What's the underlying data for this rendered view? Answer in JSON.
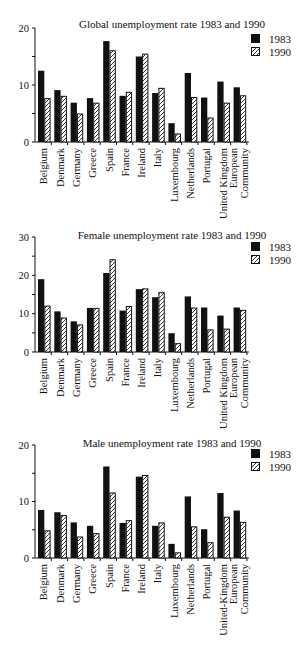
{
  "chart_data": [
    {
      "type": "bar",
      "title": "Global unemployment rate 1983 and 1990",
      "xlabel": "",
      "ylabel": "",
      "ylim": [
        0,
        20
      ],
      "yticks": [
        0,
        10,
        20
      ],
      "grid": false,
      "legend_position": "top-right",
      "categories": [
        "Belgium",
        "Denmark",
        "Germany",
        "Greece",
        "Spain",
        "France",
        "Ireland",
        "Italy",
        "Luxembourg",
        "Netherlands",
        "Portugal",
        "United Kingdom",
        "European Community"
      ],
      "category_lines": [
        [
          "Belgium"
        ],
        [
          "Denmark"
        ],
        [
          "Germany"
        ],
        [
          "Greece"
        ],
        [
          "Spain"
        ],
        [
          "France"
        ],
        [
          "Ireland"
        ],
        [
          "Italy"
        ],
        [
          "Luxembourg"
        ],
        [
          "Netherlands"
        ],
        [
          "Portugal"
        ],
        [
          "United Kingdom"
        ],
        [
          "European",
          "Community"
        ]
      ],
      "series": [
        {
          "name": "1983",
          "style": "solid",
          "values": [
            12.5,
            9.1,
            6.9,
            7.7,
            17.7,
            8.1,
            15.0,
            8.6,
            3.3,
            12.1,
            7.8,
            10.6,
            9.6
          ]
        },
        {
          "name": "1990",
          "style": "hatched",
          "values": [
            7.7,
            8.1,
            5.0,
            6.9,
            16.1,
            8.8,
            15.5,
            9.5,
            1.5,
            7.9,
            4.3,
            6.9,
            8.2
          ]
        }
      ]
    },
    {
      "type": "bar",
      "title": "Female unemployment rate 1983 and 1990",
      "xlabel": "",
      "ylabel": "",
      "ylim": [
        0,
        30
      ],
      "yticks": [
        0,
        10,
        20,
        30
      ],
      "grid": false,
      "legend_position": "top-right",
      "categories": [
        "Belgium",
        "Denmark",
        "Germany",
        "Greece",
        "Spain",
        "France",
        "Ireland",
        "Italy",
        "Luxembourg",
        "Netherlands",
        "Portugal",
        "United Kingdom",
        "European Community"
      ],
      "category_lines": [
        [
          "Belgium"
        ],
        [
          "Denmark"
        ],
        [
          "Germany"
        ],
        [
          "Greece"
        ],
        [
          "Spain"
        ],
        [
          "France"
        ],
        [
          "Ireland"
        ],
        [
          "Italy"
        ],
        [
          "Luxembourg"
        ],
        [
          "Netherlands"
        ],
        [
          "Portugal"
        ],
        [
          "United Kingdom"
        ],
        [
          "European",
          "Community"
        ]
      ],
      "series": [
        {
          "name": "1983",
          "style": "solid",
          "values": [
            19.0,
            10.6,
            8.0,
            11.5,
            20.6,
            10.8,
            16.4,
            14.3,
            4.9,
            14.5,
            11.6,
            9.5,
            11.6
          ]
        },
        {
          "name": "1990",
          "style": "hatched",
          "values": [
            12.1,
            9.0,
            7.2,
            11.5,
            24.2,
            12.0,
            16.6,
            15.6,
            2.3,
            11.6,
            5.9,
            6.1,
            11.0
          ]
        }
      ]
    },
    {
      "type": "bar",
      "title": "Male unemployment rate 1983 and 1990",
      "xlabel": "",
      "ylabel": "",
      "ylim": [
        0,
        20
      ],
      "yticks": [
        0,
        10,
        20
      ],
      "grid": false,
      "legend_position": "top-right",
      "categories": [
        "Belgium",
        "Denmark",
        "Germany",
        "Greece",
        "Spain",
        "France",
        "Ireland",
        "Italy",
        "Luxembourg",
        "Netherlands",
        "Portugal",
        "United-Kingdom",
        "European Community"
      ],
      "category_lines": [
        [
          "Belgium"
        ],
        [
          "Denmark"
        ],
        [
          "Germany"
        ],
        [
          "Greece"
        ],
        [
          "Spain"
        ],
        [
          "France"
        ],
        [
          "Ireland"
        ],
        [
          "Italy"
        ],
        [
          "Luxembourg"
        ],
        [
          "Netherlands"
        ],
        [
          "Portugal"
        ],
        [
          "United-Kingdom"
        ],
        [
          "European",
          "Community"
        ]
      ],
      "series": [
        {
          "name": "1983",
          "style": "solid",
          "values": [
            8.5,
            8.1,
            6.3,
            5.7,
            16.2,
            6.2,
            14.4,
            5.7,
            2.5,
            10.9,
            5.1,
            11.5,
            8.4
          ]
        },
        {
          "name": "1990",
          "style": "hatched",
          "values": [
            4.9,
            7.6,
            3.8,
            4.4,
            11.6,
            6.7,
            14.7,
            6.3,
            1.0,
            5.6,
            2.8,
            7.3,
            6.4
          ]
        }
      ]
    }
  ],
  "layout": {
    "colors": {
      "bar_solid": "#111111",
      "bar_hatched_fill": "#ffffff",
      "hatch_stroke": "#222222",
      "axis": "#111111"
    },
    "charts": [
      {
        "top": 0,
        "height": 225,
        "axis_x": 35,
        "y_top": 28,
        "y_zero": 142,
        "title_y": 28
      },
      {
        "top": 225,
        "height": 210,
        "axis_x": 35,
        "y_top": 12,
        "y_zero": 127,
        "title_y": 14
      },
      {
        "top": 435,
        "height": 215,
        "axis_x": 35,
        "y_top": 10,
        "y_zero": 123,
        "title_y": 12
      }
    ]
  }
}
